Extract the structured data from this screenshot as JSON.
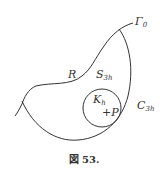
{
  "figure": {
    "caption": "図 53.",
    "labels": {
      "gamma": {
        "main": "Γ",
        "sub": "0"
      },
      "R": {
        "main": "R",
        "sub": ""
      },
      "S": {
        "main": "S",
        "sub": "3h"
      },
      "K": {
        "main": "K",
        "sub": "h"
      },
      "P": {
        "main": "+P",
        "sub": ""
      },
      "C": {
        "main": "C",
        "sub": "3h"
      }
    },
    "stroke_color": "#333333"
  }
}
